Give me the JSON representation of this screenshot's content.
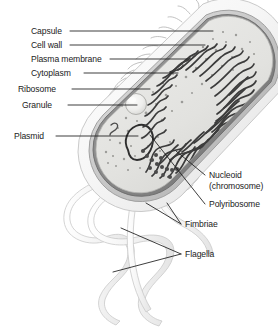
{
  "figure": {
    "type": "labeled-anatomical-diagram",
    "background_color": "#ffffff",
    "line_color": "#1b1b1b",
    "text_color": "#1b1b1b"
  },
  "labels": {
    "capsule": "Capsule",
    "cell_wall": "Cell wall",
    "plasma_membrane": "Plasma membrane",
    "cytoplasm": "Cytoplasm",
    "ribosome": "Ribosome",
    "granule": "Granule",
    "plasmid": "Plasmid",
    "nucleoid_line1": "Nucleoid",
    "nucleoid_line2": "(chromosome)",
    "polyribosome": "Polyribosome",
    "fimbriae": "Fimbriae",
    "flagella": "Flagella"
  },
  "colors": {
    "capsule_fill": "#f2f2f2",
    "cell_wall_fill": "#cfcfcf",
    "plasma_membrane_fill": "#8f8f8f",
    "cytoplasm_fill": "#e3e3e1",
    "nucleoid_stroke": "#3b3b3b",
    "flagella_fill": "#f4f4f4",
    "fimbriae_stroke": "#b5b5b5",
    "granule_fill": "#ededeb",
    "plasmid_stroke": "#2e2e2e"
  }
}
